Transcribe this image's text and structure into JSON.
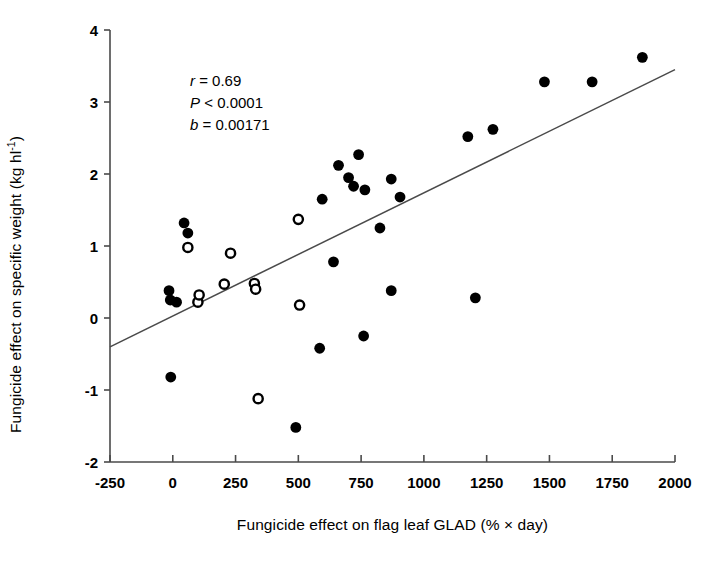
{
  "chart_data": {
    "type": "scatter",
    "title": "",
    "xlabel": "Fungicide effect on flag leaf GLAD (% × day)",
    "ylabel_parts": {
      "pre": "Fungicide effect on specific weight (kg hl",
      "sup": "-1",
      "post": ")"
    },
    "ylabel": "Fungicide effect on specific weight (kg hl-1)",
    "xlim": [
      -250,
      2000
    ],
    "ylim": [
      -2,
      4
    ],
    "xticks": [
      -250,
      0,
      250,
      500,
      750,
      1000,
      1250,
      1500,
      1750,
      2000
    ],
    "xtick_labels": [
      "-250",
      "0",
      "250",
      "500",
      "750",
      "1000",
      "1250",
      "1500",
      "1750",
      "2000"
    ],
    "yticks": [
      -2,
      -1,
      0,
      1,
      2,
      3,
      4
    ],
    "ytick_labels": [
      "-2",
      "-1",
      "0",
      "1",
      "2",
      "3",
      "4"
    ],
    "grid": false,
    "legend": null,
    "annotations": [
      {
        "name": "correlation",
        "symbol": "r",
        "relation": "=",
        "value": "0.69",
        "text": "r = 0.69"
      },
      {
        "name": "p-value",
        "symbol": "P",
        "relation": "<",
        "value": "0.0001",
        "text": "P < 0.0001"
      },
      {
        "name": "slope",
        "symbol": "b",
        "relation": "=",
        "value": "0.00171",
        "text": "b = 0.00171"
      }
    ],
    "regression_line": {
      "slope": 0.00171,
      "intercept": -0.0225,
      "x_start": -250,
      "y_start": -0.4,
      "x_end": 2000,
      "y_end": 3.45
    },
    "series": [
      {
        "name": "filled",
        "marker": "filled-circle",
        "color": "#000000",
        "points": [
          [
            -15,
            0.38
          ],
          [
            -10,
            0.25
          ],
          [
            15,
            0.22
          ],
          [
            -8,
            -0.82
          ],
          [
            45,
            1.32
          ],
          [
            60,
            1.18
          ],
          [
            660,
            2.12
          ],
          [
            700,
            1.95
          ],
          [
            720,
            1.83
          ],
          [
            740,
            2.27
          ],
          [
            765,
            1.78
          ],
          [
            870,
            1.93
          ],
          [
            905,
            1.68
          ],
          [
            595,
            1.65
          ],
          [
            640,
            0.78
          ],
          [
            825,
            1.25
          ],
          [
            870,
            0.38
          ],
          [
            1205,
            0.28
          ],
          [
            760,
            -0.25
          ],
          [
            585,
            -0.42
          ],
          [
            490,
            -1.52
          ],
          [
            1175,
            2.52
          ],
          [
            1275,
            2.62
          ],
          [
            1480,
            3.28
          ],
          [
            1670,
            3.28
          ],
          [
            1870,
            3.62
          ]
        ]
      },
      {
        "name": "open",
        "marker": "open-circle",
        "color": "#000000",
        "points": [
          [
            60,
            0.98
          ],
          [
            100,
            0.22
          ],
          [
            105,
            0.32
          ],
          [
            205,
            0.47
          ],
          [
            230,
            0.9
          ],
          [
            325,
            0.48
          ],
          [
            330,
            0.4
          ],
          [
            500,
            1.37
          ],
          [
            505,
            0.18
          ],
          [
            340,
            -1.12
          ]
        ]
      }
    ]
  }
}
